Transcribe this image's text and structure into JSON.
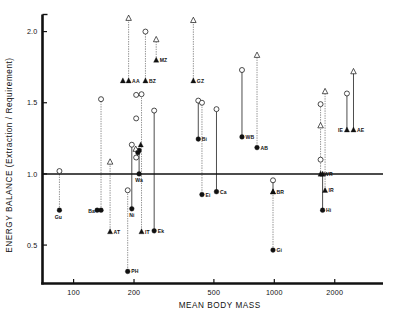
{
  "chart_data": {
    "type": "scatter",
    "title": "",
    "xlabel": "MEAN BODY MASS",
    "ylabel": "ENERGY BALANCE (Extraction / Requirement)",
    "xscale": "log",
    "xlim": [
      70,
      3400
    ],
    "ylim": [
      0.23,
      2.12
    ],
    "xticks": [
      100,
      200,
      500,
      1000,
      2000
    ],
    "xticklabels": [
      "100",
      "200",
      "500",
      "1000",
      "2000"
    ],
    "yticks": [
      0.5,
      1.0,
      1.5,
      2.0
    ],
    "yticklabels": [
      "0.5",
      "1.0",
      "1.5",
      "2.0"
    ],
    "grid": false,
    "legend": null,
    "reference_line": {
      "y": 1.0,
      "label": ""
    },
    "marker_types": {
      "open_circle": "open-circle",
      "filled_circle": "filled-circle",
      "open_triangle": "open-triangle",
      "filled_triangle": "filled-triangle"
    },
    "points": [
      {
        "label": "Gu",
        "x": 85,
        "y_low": 0.745,
        "y_high": 1.02,
        "low_marker": "filled-circle",
        "high_marker": "open-circle",
        "stem": "dotted",
        "label_dx": -1,
        "label_dy": 9,
        "label_anchor": "middle"
      },
      {
        "label": "Ba",
        "x": 137,
        "y_low": 0.745,
        "y_high": 1.525,
        "low_marker": "filled-circle",
        "high_marker": "open-circle",
        "stem": "dotted",
        "label_dx": -6,
        "label_dy": 2.5,
        "label_anchor": "end"
      },
      {
        "label": "AT",
        "x": 152,
        "y_low": 0.595,
        "y_high": 1.085,
        "low_marker": "filled-triangle",
        "high_marker": "open-triangle",
        "stem": "dotted",
        "label_dx": 3.5,
        "label_dy": 2,
        "label_anchor": "start"
      },
      {
        "label": "PH",
        "x": 186,
        "y_low": 0.315,
        "y_high": 0.885,
        "low_marker": "filled-circle",
        "high_marker": "open-circle",
        "stem": "dotted",
        "label_dx": 3.5,
        "label_dy": 2,
        "label_anchor": "start"
      },
      {
        "label": "Ni",
        "x": 195,
        "y_low": 0.755,
        "y_high": 1.205,
        "low_marker": "filled-circle",
        "high_marker": "open-circle",
        "stem": "solid",
        "label_dx": 0,
        "label_dy": 8.5,
        "label_anchor": "middle"
      },
      {
        "label": "AA",
        "x": 188,
        "y_low": 1.655,
        "y_high": 2.095,
        "low_marker": "filled-triangle",
        "high_marker": "open-triangle",
        "stem": "dotted",
        "label_dx": 3.5,
        "label_dy": 2,
        "label_anchor": "start"
      },
      {
        "label": "Wa",
        "x": 212,
        "y_low": 1.0,
        "y_high": 1.165,
        "low_marker": "filled-circle",
        "high_marker": "filled-circle",
        "stem": "solid",
        "label_dx": 0,
        "label_dy": 8.5,
        "label_anchor": "middle"
      },
      {
        "label": "IT",
        "x": 218,
        "y_low": 0.595,
        "y_high": 1.56,
        "low_marker": "filled-triangle",
        "high_marker": "open-circle",
        "stem": "dotted",
        "label_dx": 3.5,
        "label_dy": 2,
        "label_anchor": "start"
      },
      {
        "label": "BZ",
        "x": 228,
        "y_low": 1.655,
        "y_high": 2.0,
        "low_marker": "filled-triangle",
        "high_marker": "open-circle",
        "stem": "dotted",
        "label_dx": 3.5,
        "label_dy": 2,
        "label_anchor": "start"
      },
      {
        "label": "Ek",
        "x": 252,
        "y_low": 0.6,
        "y_high": 1.445,
        "low_marker": "filled-circle",
        "high_marker": "open-circle",
        "stem": "solid",
        "label_dx": 3.5,
        "label_dy": 2,
        "label_anchor": "start"
      },
      {
        "label": "MZ",
        "x": 258,
        "y_low": 1.8,
        "y_high": 1.945,
        "low_marker": "filled-triangle",
        "high_marker": "open-triangle",
        "stem": "dotted",
        "label_dx": 3.5,
        "label_dy": 2,
        "label_anchor": "start"
      },
      {
        "label": "GZ",
        "x": 395,
        "y_low": 1.655,
        "y_high": 2.08,
        "low_marker": "filled-triangle",
        "high_marker": "open-triangle",
        "stem": "dotted",
        "label_dx": 3.5,
        "label_dy": 2,
        "label_anchor": "start"
      },
      {
        "label": "Bi",
        "x": 418,
        "y_low": 1.245,
        "y_high": 1.515,
        "low_marker": "filled-circle",
        "high_marker": "open-circle",
        "stem": "solid",
        "label_dx": 3.5,
        "label_dy": 2,
        "label_anchor": "start"
      },
      {
        "label": "Ei",
        "x": 436,
        "y_low": 0.855,
        "y_high": 1.5,
        "low_marker": "filled-circle",
        "high_marker": "open-circle",
        "stem": "dotted",
        "label_dx": 3.5,
        "label_dy": 2,
        "label_anchor": "start"
      },
      {
        "label": "Ca",
        "x": 515,
        "y_low": 0.875,
        "y_high": 1.455,
        "low_marker": "filled-circle",
        "high_marker": "open-circle",
        "stem": "solid",
        "label_dx": 3.5,
        "label_dy": 2,
        "label_anchor": "start"
      },
      {
        "label": "WB",
        "x": 690,
        "y_low": 1.26,
        "y_high": 1.73,
        "low_marker": "filled-circle",
        "high_marker": "open-circle",
        "stem": "solid",
        "label_dx": 3.5,
        "label_dy": 2,
        "label_anchor": "start"
      },
      {
        "label": "AB",
        "x": 820,
        "y_low": 1.185,
        "y_high": 1.835,
        "low_marker": "filled-circle",
        "high_marker": "open-triangle",
        "stem": "dotted",
        "label_dx": 3.5,
        "label_dy": 2,
        "label_anchor": "start"
      },
      {
        "label": "BR",
        "x": 985,
        "y_low": 0.875,
        "y_high": 0.955,
        "low_marker": "filled-triangle",
        "high_marker": "open-circle",
        "stem": "solid",
        "label_dx": 3.5,
        "label_dy": 2,
        "label_anchor": "start"
      },
      {
        "label": "Gi",
        "x": 985,
        "y_low": 0.465,
        "y_high": 0.875,
        "low_marker": "filled-circle",
        "high_marker": "filled-triangle",
        "stem": "dotted",
        "label_dx": 3.5,
        "label_dy": 2,
        "label_anchor": "start"
      },
      {
        "label": "WR",
        "x": 1700,
        "y_low": 1.0,
        "y_high": 1.49,
        "low_marker": "filled-triangle",
        "high_marker": "open-circle",
        "stem": "dotted",
        "label_dx": 3.5,
        "label_dy": 2,
        "label_anchor": "start"
      },
      {
        "label": "Hi",
        "x": 1740,
        "y_low": 0.745,
        "y_high": 1.0,
        "low_marker": "filled-circle",
        "high_marker": "filled-triangle",
        "stem": "solid",
        "label_dx": 3.5,
        "label_dy": 2,
        "label_anchor": "start"
      },
      {
        "label": "IR",
        "x": 1790,
        "y_low": 0.885,
        "y_high": 1.58,
        "low_marker": "filled-triangle",
        "high_marker": "open-triangle",
        "stem": "dotted",
        "label_dx": 3.5,
        "label_dy": 2,
        "label_anchor": "start"
      },
      {
        "label": "IE",
        "x": 2300,
        "y_low": 1.31,
        "y_high": 1.565,
        "low_marker": "filled-triangle",
        "high_marker": "open-circle",
        "stem": "solid",
        "label_dx": -4,
        "label_dy": 2,
        "label_anchor": "end"
      },
      {
        "label": "AE",
        "x": 2480,
        "y_low": 1.31,
        "y_high": 1.72,
        "low_marker": "filled-triangle",
        "high_marker": "open-triangle",
        "stem": "solid",
        "label_dx": 3.5,
        "label_dy": 2,
        "label_anchor": "start"
      }
    ],
    "extra_markers": [
      {
        "name": "wa-cluster-open-tri-a",
        "x": 204,
        "y": 1.175,
        "marker": "open-triangle"
      },
      {
        "name": "wa-cluster-open-cir-a",
        "x": 205,
        "y": 1.115,
        "marker": "open-circle"
      },
      {
        "name": "wa-cluster-fill-cir-a",
        "x": 209,
        "y": 1.15,
        "marker": "filled-circle"
      },
      {
        "name": "wa-cluster-fill-tri-a",
        "x": 216,
        "y": 1.205,
        "marker": "filled-triangle"
      },
      {
        "name": "aa-second-triangle",
        "x": 176,
        "y": 1.655,
        "marker": "filled-triangle"
      },
      {
        "name": "ba-second-filled",
        "x": 131,
        "y": 0.745,
        "marker": "filled-circle"
      },
      {
        "name": "it-upper-open-circle",
        "x": 205,
        "y": 1.39,
        "marker": "open-circle"
      },
      {
        "name": "it-upper-open-circle2",
        "x": 205,
        "y": 1.555,
        "marker": "open-circle"
      },
      {
        "name": "wr-low-open-circle",
        "x": 1700,
        "y": 1.1,
        "marker": "open-circle"
      },
      {
        "name": "ir-low-open-triangle",
        "x": 1700,
        "y": 1.34,
        "marker": "open-triangle"
      }
    ]
  }
}
